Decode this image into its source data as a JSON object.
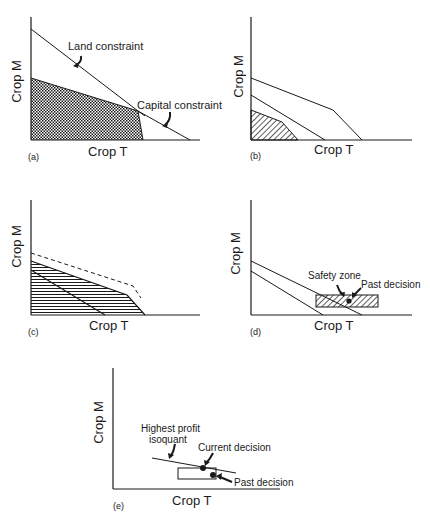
{
  "figure": {
    "panels": [
      {
        "id": "a",
        "label": "(a)",
        "xlabel": "Crop T",
        "ylabel": "Crop M",
        "annotations": [
          "Land constraint",
          "Capital constraint"
        ]
      },
      {
        "id": "b",
        "label": "(b)",
        "xlabel": "Crop T",
        "ylabel": "Crop M"
      },
      {
        "id": "c",
        "label": "(c)",
        "xlabel": "Crop T",
        "ylabel": "Crop M"
      },
      {
        "id": "d",
        "label": "(d)",
        "xlabel": "Crop T",
        "ylabel": "Crop M",
        "annotations": [
          "Safety zone",
          "Past decision"
        ]
      },
      {
        "id": "e",
        "label": "(e)",
        "xlabel": "Crop T",
        "ylabel": "Crop M",
        "annotations": [
          "Highest profit",
          "isoquant",
          "Current decision",
          "Past decision"
        ]
      }
    ]
  }
}
